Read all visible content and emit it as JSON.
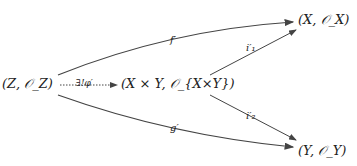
{
  "nodes": {
    "z": "(Z, 𝒪_Z)",
    "xy": "(X × Y, 𝒪_{X×Y})",
    "x": "(X, 𝒪_X)",
    "y": "(Y, 𝒪_Y)"
  },
  "arrows": {
    "f": "f′",
    "g": "g′",
    "phi": "∃!φ′",
    "i1": "i′₁",
    "i2": "i′₂"
  }
}
